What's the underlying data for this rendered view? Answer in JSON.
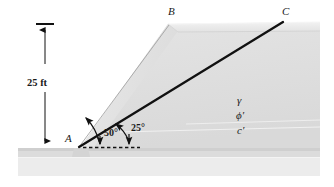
{
  "figure": {
    "type": "engineering-diagram",
    "points": {
      "a": "A",
      "b": "B",
      "c": "C"
    },
    "dimension": {
      "height_label": "25 ft"
    },
    "angles": {
      "slope_face": "50°",
      "failure_plane": "25°"
    },
    "soil_properties": {
      "unit_weight": "γ",
      "friction_angle": "ϕ′",
      "cohesion": "c′"
    },
    "credit": "© Cengage Learning 2014",
    "colors": {
      "line": "#111111",
      "slope_fill_light": "#e6e6e6",
      "slope_fill_mid": "#dcdcdc",
      "crest_fill": "#ededed",
      "ground_fill": "#d8d8d8",
      "ground_fill_light": "#eaeaea",
      "credit_text": "#8d8d8d"
    },
    "geometry": {
      "toe_a": [
        78,
        147
      ],
      "crest_b": [
        168,
        24
      ],
      "crest_right_c": [
        283,
        22
      ],
      "dim_line_x": 45,
      "dim_top_y": 24,
      "dim_bottom_y": 147,
      "ground_y": 147,
      "slope_angle_deg": 50,
      "plane_angle_deg": 25
    }
  }
}
